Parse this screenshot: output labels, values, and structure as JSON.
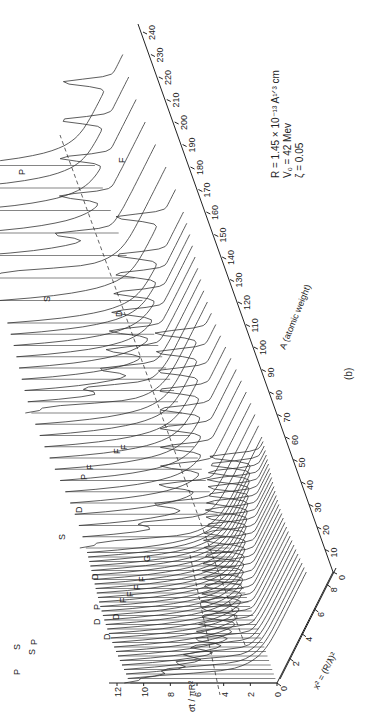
{
  "figure": {
    "panel_label": "(b)",
    "parameters": [
      "R = 1.45 × 10⁻¹³ A¹ᐟ³ cm",
      "V₀ = 42 Mev",
      "ζ = 0.05"
    ],
    "axes": {
      "y_label_num": "σ̄t",
      "y_label_den": "πR²",
      "y_ticks": [
        "0",
        "2",
        "4",
        "6",
        "8",
        "10",
        "12"
      ],
      "x_label": "x² = (R/ƛ)²",
      "x_ticks": [
        "0",
        "2",
        "4",
        "6",
        "8"
      ],
      "a_label": "A (atomic weight)",
      "a_ticks": [
        "0",
        "10",
        "20",
        "30",
        "40",
        "50",
        "60",
        "70",
        "80",
        "90",
        "100",
        "110",
        "120",
        "130",
        "140",
        "150",
        "160",
        "170",
        "180",
        "190",
        "200",
        "210",
        "220",
        "230",
        "240"
      ]
    },
    "resonance_labels": [
      "P",
      "S",
      "P",
      "S",
      "P",
      "D",
      "D",
      "D",
      "D",
      "F",
      "F",
      "F",
      "F",
      "G",
      "S",
      "D",
      "P",
      "F",
      "F",
      "F",
      "S",
      "D",
      "F",
      "P"
    ]
  },
  "chart_data": {
    "type": "line",
    "title": "",
    "xlabel": "x² = (R/ƛ)²",
    "ylabel": "σ̄t / πR²",
    "zlabel": "A (atomic weight)",
    "xlim": [
      0,
      9
    ],
    "ylim": [
      0,
      13
    ],
    "zlim": [
      0,
      240
    ],
    "x_ticks": [
      0,
      2,
      4,
      6,
      8
    ],
    "y_ticks": [
      0,
      2,
      4,
      6,
      8,
      10,
      12
    ],
    "z_ticks": [
      0,
      10,
      20,
      30,
      40,
      50,
      60,
      70,
      80,
      90,
      100,
      110,
      120,
      130,
      140,
      150,
      160,
      170,
      180,
      190,
      200,
      210,
      220,
      230,
      240
    ],
    "parameters": {
      "R": "1.45 × 10⁻¹³ A^(1/3) cm",
      "V0": "42 Mev",
      "zeta": 0.05
    },
    "resonance_annotations": [
      {
        "label": "S",
        "A_approx": 0,
        "peak": 11
      },
      {
        "label": "P",
        "A_approx": 2,
        "peak": 12
      },
      {
        "label": "P",
        "A_approx": 5,
        "peak": 11
      },
      {
        "label": "S",
        "A_approx": 12,
        "peak": 10
      },
      {
        "label": "D",
        "A_approx": 12,
        "peak": 6.5
      },
      {
        "label": "D",
        "A_approx": 18,
        "peak": 6.5
      },
      {
        "label": "P",
        "A_approx": 28,
        "peak": 9
      },
      {
        "label": "F",
        "A_approx": 22,
        "peak": 3.5
      },
      {
        "label": "F",
        "A_approx": 25,
        "peak": 4
      },
      {
        "label": "F",
        "A_approx": 28,
        "peak": 4
      },
      {
        "label": "F",
        "A_approx": 31,
        "peak": 4
      },
      {
        "label": "G",
        "A_approx": 20,
        "peak": 2
      },
      {
        "label": "S",
        "A_approx": 45,
        "peak": 11
      },
      {
        "label": "D",
        "A_approx": 45,
        "peak": 6.5
      },
      {
        "label": "D",
        "A_approx": 40,
        "peak": 6.5
      },
      {
        "label": "P",
        "A_approx": 98,
        "peak": 10
      },
      {
        "label": "F",
        "A_approx": 75,
        "peak": 6.5
      },
      {
        "label": "F",
        "A_approx": 70,
        "peak": 6.5
      },
      {
        "label": "F",
        "A_approx": 65,
        "peak": 4
      },
      {
        "label": "S",
        "A_approx": 140,
        "peak": 11
      },
      {
        "label": "D",
        "A_approx": 135,
        "peak": 7
      },
      {
        "label": "F",
        "A_approx": 190,
        "peak": 7
      },
      {
        "label": "P",
        "A_approx": 220,
        "peak": 11
      }
    ]
  }
}
